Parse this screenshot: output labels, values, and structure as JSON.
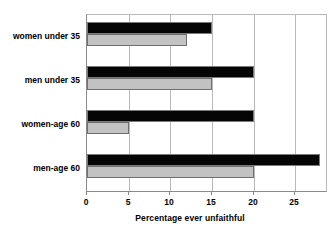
{
  "chart_data": {
    "type": "bar",
    "orientation": "horizontal",
    "title": "",
    "xlabel": "Percentage ever unfaithful",
    "ylabel": "",
    "xlim": [
      0,
      28.7
    ],
    "xticks": [
      0,
      5,
      10,
      15,
      20,
      25
    ],
    "xticklabels": [
      "0",
      "5",
      "10",
      "15",
      "20",
      "25"
    ],
    "grid": true,
    "grid_axis": "x",
    "legend": "none",
    "categories": [
      "women under 35",
      "men under 35",
      "women-age 60",
      "men-age 60"
    ],
    "series": [
      {
        "name": "black",
        "color": "#050505",
        "values": [
          15,
          20,
          20,
          28
        ]
      },
      {
        "name": "gray",
        "color": "#c2c2c2",
        "values": [
          12,
          15,
          5,
          20
        ]
      }
    ]
  },
  "colors": {
    "background": "#ffffff",
    "axis": "#8a8a8a",
    "gridline": "#b9b9b9",
    "bar_black": "#050505",
    "bar_gray": "#c2c2c2",
    "bar_border": "#6f6f6f",
    "text": "#000000"
  }
}
